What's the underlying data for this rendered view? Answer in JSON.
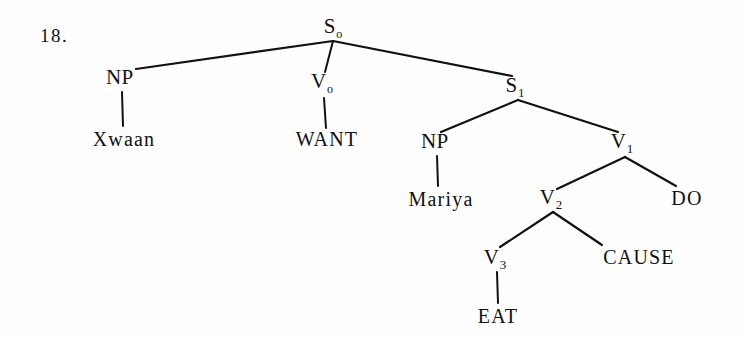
{
  "page": {
    "item_number": "18.",
    "background_color": "#fefefe",
    "ink_color": "#111111",
    "width": 747,
    "height": 339
  },
  "tree": {
    "description": "Generative-semantics syntactic decomposition tree",
    "nodes": {
      "s0": {
        "label": "S",
        "subscript": "o",
        "x": 333,
        "y": 28
      },
      "np0": {
        "label": "NP",
        "subscript": "",
        "x": 120,
        "y": 79
      },
      "v0": {
        "label": "V",
        "subscript": "o",
        "x": 322,
        "y": 83
      },
      "s1": {
        "label": "S",
        "subscript": "1",
        "x": 515,
        "y": 87
      },
      "xwaan": {
        "label": "Xwaan",
        "subscript": "",
        "x": 124,
        "y": 139
      },
      "want": {
        "label": "WANT",
        "subscript": "",
        "x": 327,
        "y": 139
      },
      "np1": {
        "label": "NP",
        "subscript": "",
        "x": 435,
        "y": 143
      },
      "v1": {
        "label": "V",
        "subscript": "1",
        "x": 622,
        "y": 143
      },
      "mariya": {
        "label": "Mariya",
        "subscript": "",
        "x": 441,
        "y": 199
      },
      "v2": {
        "label": "V",
        "subscript": "2",
        "x": 551,
        "y": 199
      },
      "do": {
        "label": "DO",
        "subscript": "",
        "x": 687,
        "y": 198
      },
      "v3": {
        "label": "V",
        "subscript": "3",
        "x": 495,
        "y": 259
      },
      "cause": {
        "label": "CAUSE",
        "subscript": "",
        "x": 639,
        "y": 257
      },
      "eat": {
        "label": "EAT",
        "subscript": "",
        "x": 498,
        "y": 316
      }
    },
    "edges": [
      {
        "from": "s0",
        "to": "np0",
        "x1": 333,
        "y1": 41,
        "x2": 136,
        "y2": 69,
        "kind": "branch"
      },
      {
        "from": "s0",
        "to": "v0",
        "x1": 333,
        "y1": 41,
        "x2": 325,
        "y2": 72,
        "kind": "stem"
      },
      {
        "from": "s0",
        "to": "s1",
        "x1": 333,
        "y1": 41,
        "x2": 512,
        "y2": 76,
        "kind": "branch"
      },
      {
        "from": "np0",
        "to": "xwaan",
        "x1": 122,
        "y1": 92,
        "x2": 123,
        "y2": 126,
        "kind": "stem"
      },
      {
        "from": "v0",
        "to": "want",
        "x1": 324,
        "y1": 98,
        "x2": 326,
        "y2": 128,
        "kind": "stem"
      },
      {
        "from": "s1",
        "to": "np1",
        "x1": 518,
        "y1": 100,
        "x2": 441,
        "y2": 132,
        "kind": "branch"
      },
      {
        "from": "s1",
        "to": "v1",
        "x1": 518,
        "y1": 100,
        "x2": 618,
        "y2": 132,
        "kind": "branch"
      },
      {
        "from": "np1",
        "to": "mariya",
        "x1": 437,
        "y1": 156,
        "x2": 438,
        "y2": 186,
        "kind": "stem"
      },
      {
        "from": "v1",
        "to": "v2",
        "x1": 625,
        "y1": 157,
        "x2": 557,
        "y2": 189,
        "kind": "branch"
      },
      {
        "from": "v1",
        "to": "do",
        "x1": 625,
        "y1": 157,
        "x2": 676,
        "y2": 186,
        "kind": "branch"
      },
      {
        "from": "v2",
        "to": "v3",
        "x1": 553,
        "y1": 212,
        "x2": 500,
        "y2": 247,
        "kind": "branch"
      },
      {
        "from": "v2",
        "to": "cause",
        "x1": 553,
        "y1": 212,
        "x2": 602,
        "y2": 245,
        "kind": "branch"
      },
      {
        "from": "v3",
        "to": "eat",
        "x1": 497,
        "y1": 272,
        "x2": 498,
        "y2": 303,
        "kind": "stem"
      }
    ]
  }
}
